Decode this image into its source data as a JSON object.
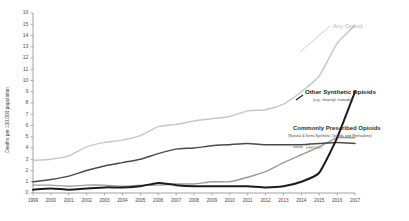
{
  "chart_data": {
    "type": "line",
    "title": "",
    "xlabel": "",
    "ylabel": "Deaths per 100,000 population",
    "xlim": [
      1999,
      2017
    ],
    "ylim": [
      0,
      16
    ],
    "grid": false,
    "legend_position": "inline-end-of-line",
    "x": [
      1999,
      2000,
      2001,
      2002,
      2003,
      2004,
      2005,
      2006,
      2007,
      2008,
      2009,
      2010,
      2011,
      2012,
      2013,
      2014,
      2015,
      2016,
      2017
    ],
    "xtick_labels": [
      "1999",
      "2000",
      "2001",
      "2002",
      "2003",
      "2004",
      "2005",
      "2006",
      "2007",
      "2008",
      "2009",
      "2010",
      "2011",
      "2012",
      "2013",
      "2014",
      "2015",
      "2016",
      "2017"
    ],
    "ytick_labels": [
      "0",
      "1",
      "2",
      "3",
      "4",
      "5",
      "6",
      "7",
      "8",
      "9",
      "10",
      "11",
      "12",
      "13",
      "14",
      "15",
      "16"
    ],
    "ytick_values": [
      0,
      1,
      2,
      3,
      4,
      5,
      6,
      7,
      8,
      9,
      10,
      11,
      12,
      13,
      14,
      15,
      16
    ],
    "series": [
      {
        "name": "Any Opioid",
        "label": "Any Opioid",
        "sublabel": "",
        "color": "#c7c7c7",
        "values": [
          2.9,
          3.0,
          3.3,
          4.1,
          4.5,
          4.7,
          5.1,
          5.9,
          6.1,
          6.4,
          6.6,
          6.8,
          7.3,
          7.4,
          7.9,
          9.0,
          10.4,
          13.3,
          14.9
        ]
      },
      {
        "name": "Other Synthetic Opioids",
        "label": "Other Synthetic Opioids",
        "sublabel": "(e.g., fentanyl, tramadol)",
        "color": "#1c1c1c",
        "values": [
          0.3,
          0.4,
          0.3,
          0.4,
          0.5,
          0.5,
          0.6,
          0.9,
          0.7,
          0.6,
          0.6,
          0.6,
          0.6,
          0.5,
          0.6,
          1.0,
          1.8,
          4.9,
          9.0
        ]
      },
      {
        "name": "Commonly Prescribed Opioids",
        "label": "Commonly Prescribed Opioids",
        "sublabel": "(Natural & Semi-Synthetic Opioids and Methadone)",
        "color": "#4a4a4a",
        "values": [
          1.0,
          1.2,
          1.5,
          2.0,
          2.4,
          2.7,
          3.0,
          3.5,
          3.9,
          4.0,
          4.2,
          4.3,
          4.4,
          4.3,
          4.3,
          4.3,
          4.4,
          4.5,
          4.4
        ]
      },
      {
        "name": "Heroin",
        "label": "Heroin",
        "sublabel": "",
        "color": "#9a9a9a",
        "values": [
          0.7,
          0.7,
          0.6,
          0.7,
          0.7,
          0.6,
          0.7,
          0.7,
          0.8,
          0.8,
          1.0,
          1.0,
          1.4,
          1.9,
          2.7,
          3.4,
          4.1,
          4.9,
          4.9
        ]
      }
    ]
  },
  "axis": {
    "y_title": "Deaths per 100,000 population"
  },
  "labels": {
    "any_opioid": "Any Opioid",
    "other_synthetic": "Other Synthetic Opioids",
    "other_synthetic_sub": "(e.g., fentanyl, tramadol)",
    "prescribed": "Commonly Prescribed Opioids",
    "prescribed_sub": "(Natural & Semi-Synthetic Opioids and Methadone)",
    "heroin": "Heroin"
  }
}
